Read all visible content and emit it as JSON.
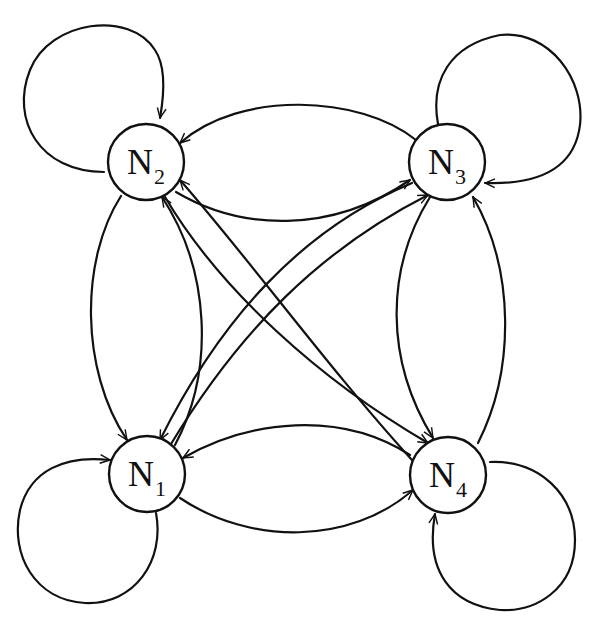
{
  "diagram": {
    "type": "complete-directed-graph-with-self-loops",
    "colors": {
      "stroke": "#111111",
      "background": "#ffffff"
    },
    "nodes": [
      {
        "id": "N1",
        "label": "N",
        "subscript": "1",
        "cx": 147,
        "cy": 474,
        "r": 38
      },
      {
        "id": "N2",
        "label": "N",
        "subscript": "2",
        "cx": 146,
        "cy": 162,
        "r": 38
      },
      {
        "id": "N3",
        "label": "N",
        "subscript": "3",
        "cx": 447,
        "cy": 162,
        "r": 38
      },
      {
        "id": "N4",
        "label": "N",
        "subscript": "4",
        "cx": 448,
        "cy": 475,
        "r": 38
      }
    ],
    "edges": [
      {
        "from": "N1",
        "to": "N1",
        "kind": "self-loop"
      },
      {
        "from": "N2",
        "to": "N2",
        "kind": "self-loop"
      },
      {
        "from": "N3",
        "to": "N3",
        "kind": "self-loop"
      },
      {
        "from": "N4",
        "to": "N4",
        "kind": "self-loop"
      },
      {
        "from": "N3",
        "to": "N2",
        "kind": "curve-top"
      },
      {
        "from": "N2",
        "to": "N3",
        "kind": "curve-inner"
      },
      {
        "from": "N2",
        "to": "N1",
        "kind": "curve-outer-left"
      },
      {
        "from": "N1",
        "to": "N2",
        "kind": "curve-inner-left"
      },
      {
        "from": "N1",
        "to": "N4",
        "kind": "curve-bottom"
      },
      {
        "from": "N4",
        "to": "N1",
        "kind": "curve-inner-bottom"
      },
      {
        "from": "N4",
        "to": "N3",
        "kind": "curve-outer-right"
      },
      {
        "from": "N3",
        "to": "N4",
        "kind": "curve-inner-right"
      },
      {
        "from": "N1",
        "to": "N3",
        "kind": "diagonal"
      },
      {
        "from": "N3",
        "to": "N1",
        "kind": "diagonal"
      },
      {
        "from": "N2",
        "to": "N4",
        "kind": "diagonal"
      },
      {
        "from": "N4",
        "to": "N2",
        "kind": "diagonal"
      }
    ]
  }
}
